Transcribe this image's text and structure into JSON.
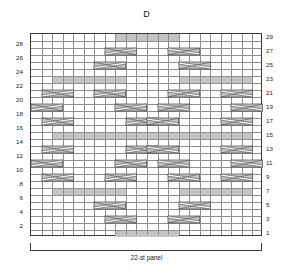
{
  "chart": {
    "title": "D",
    "caption": "22-st panel",
    "type": "knitting-cable-chart"
  },
  "chart_data": {
    "type": "heatmap",
    "title": "D",
    "xlabel": "22-st panel",
    "ylabel": "",
    "columns": 22,
    "rows": 29,
    "xlim": [
      1,
      22
    ],
    "ylim": [
      1,
      29
    ],
    "grid": true,
    "legend": "none",
    "row_labels_left": [
      28,
      26,
      24,
      22,
      20,
      18,
      16,
      14,
      12,
      10,
      8,
      6,
      4,
      2
    ],
    "row_labels_right": [
      29,
      27,
      25,
      23,
      21,
      19,
      17,
      15,
      13,
      11,
      9,
      7,
      5,
      3,
      1
    ],
    "colors": {
      "shaded_cell": "#c3c3c3",
      "grid_line": "#8e8e8e",
      "border": "#3a3a3a",
      "background": "#ffffff",
      "symbol_fill": "#c3c3c3",
      "symbol_line": "#4a4a4a"
    },
    "shaded_runs": [
      {
        "row": 29,
        "col_start": 9,
        "col_end": 14
      },
      {
        "row": 23,
        "col_start": 3,
        "col_end": 9
      },
      {
        "row": 23,
        "col_start": 15,
        "col_end": 21
      },
      {
        "row": 15,
        "col_start": 3,
        "col_end": 21
      },
      {
        "row": 7,
        "col_start": 3,
        "col_end": 9
      },
      {
        "row": 7,
        "col_start": 15,
        "col_end": 21
      },
      {
        "row": 1,
        "col_start": 9,
        "col_end": 14
      }
    ],
    "cables": [
      {
        "row": 27,
        "col_start": 8,
        "col_end": 10,
        "dir": "right"
      },
      {
        "row": 27,
        "col_start": 14,
        "col_end": 16,
        "dir": "left"
      },
      {
        "row": 25,
        "col_start": 7,
        "col_end": 9,
        "dir": "right"
      },
      {
        "row": 25,
        "col_start": 15,
        "col_end": 17,
        "dir": "left"
      },
      {
        "row": 21,
        "col_start": 2,
        "col_end": 4,
        "dir": "right"
      },
      {
        "row": 21,
        "col_start": 7,
        "col_end": 9,
        "dir": "right"
      },
      {
        "row": 21,
        "col_start": 14,
        "col_end": 16,
        "dir": "left"
      },
      {
        "row": 21,
        "col_start": 19,
        "col_end": 21,
        "dir": "left"
      },
      {
        "row": 19,
        "col_start": 1,
        "col_end": 3,
        "dir": "right"
      },
      {
        "row": 19,
        "col_start": 9,
        "col_end": 11,
        "dir": "right"
      },
      {
        "row": 19,
        "col_start": 13,
        "col_end": 15,
        "dir": "left"
      },
      {
        "row": 19,
        "col_start": 20,
        "col_end": 22,
        "dir": "left"
      },
      {
        "row": 17,
        "col_start": 2,
        "col_end": 4,
        "dir": "right"
      },
      {
        "row": 17,
        "col_start": 10,
        "col_end": 12,
        "dir": "right"
      },
      {
        "row": 17,
        "col_start": 12,
        "col_end": 14,
        "dir": "left"
      },
      {
        "row": 17,
        "col_start": 19,
        "col_end": 21,
        "dir": "left"
      },
      {
        "row": 13,
        "col_start": 2,
        "col_end": 4,
        "dir": "right"
      },
      {
        "row": 13,
        "col_start": 10,
        "col_end": 12,
        "dir": "right"
      },
      {
        "row": 13,
        "col_start": 12,
        "col_end": 14,
        "dir": "left"
      },
      {
        "row": 13,
        "col_start": 19,
        "col_end": 21,
        "dir": "left"
      },
      {
        "row": 11,
        "col_start": 1,
        "col_end": 3,
        "dir": "right"
      },
      {
        "row": 11,
        "col_start": 9,
        "col_end": 11,
        "dir": "right"
      },
      {
        "row": 11,
        "col_start": 13,
        "col_end": 15,
        "dir": "left"
      },
      {
        "row": 11,
        "col_start": 20,
        "col_end": 22,
        "dir": "left"
      },
      {
        "row": 9,
        "col_start": 2,
        "col_end": 4,
        "dir": "right"
      },
      {
        "row": 9,
        "col_start": 8,
        "col_end": 10,
        "dir": "right"
      },
      {
        "row": 9,
        "col_start": 14,
        "col_end": 16,
        "dir": "left"
      },
      {
        "row": 9,
        "col_start": 19,
        "col_end": 21,
        "dir": "left"
      },
      {
        "row": 5,
        "col_start": 7,
        "col_end": 9,
        "dir": "right"
      },
      {
        "row": 5,
        "col_start": 15,
        "col_end": 17,
        "dir": "left"
      },
      {
        "row": 3,
        "col_start": 8,
        "col_end": 10,
        "dir": "right"
      },
      {
        "row": 3,
        "col_start": 14,
        "col_end": 16,
        "dir": "left"
      }
    ]
  }
}
